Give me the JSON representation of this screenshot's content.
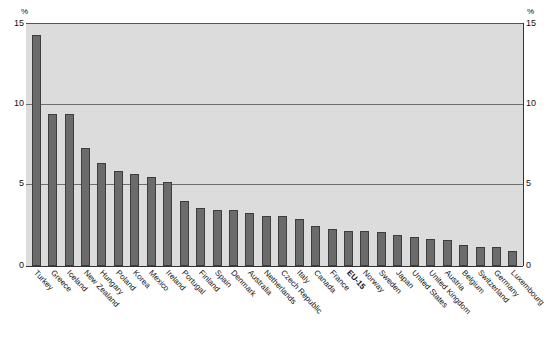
{
  "chart_data": {
    "type": "bar",
    "title": "",
    "xlabel": "",
    "ylabel": "%",
    "ylim": [
      0,
      15
    ],
    "yticks": [
      0,
      5,
      10,
      15
    ],
    "ytick_labels": [
      "0",
      "5",
      "10",
      "15"
    ],
    "unit_label_left": "%",
    "unit_label_right": "%",
    "grid": true,
    "grid_axis": "y",
    "legend": "none",
    "dual_axis": true,
    "bar_color": "#6b6b6b",
    "bar_edge_color": "#3d3d3d",
    "plot_background": "#dcdcdc",
    "categories": [
      "Turkey",
      "Greece",
      "Iceland",
      "New Zealand",
      "Hungary",
      "Poland",
      "Korea",
      "Mexico",
      "Ireland",
      "Portugal",
      "Finland",
      "Spain",
      "Denmark",
      "Australia",
      "Netherlands",
      "Czech Republic",
      "Italy",
      "Canada",
      "France",
      "EU-15",
      "Norway",
      "Sweden",
      "Japan",
      "United States",
      "United Kingdom",
      "Austria",
      "Belgium",
      "Switzerland",
      "Germany",
      "Luxembourg"
    ],
    "highlighted_categories": [
      "EU-15"
    ],
    "values": [
      14.3,
      9.4,
      9.4,
      7.3,
      6.4,
      5.9,
      5.7,
      5.5,
      5.2,
      4.0,
      3.6,
      3.5,
      3.5,
      3.3,
      3.1,
      3.1,
      2.9,
      2.5,
      2.3,
      2.2,
      2.2,
      2.1,
      1.9,
      1.8,
      1.7,
      1.6,
      1.3,
      1.2,
      1.2,
      0.9
    ]
  }
}
